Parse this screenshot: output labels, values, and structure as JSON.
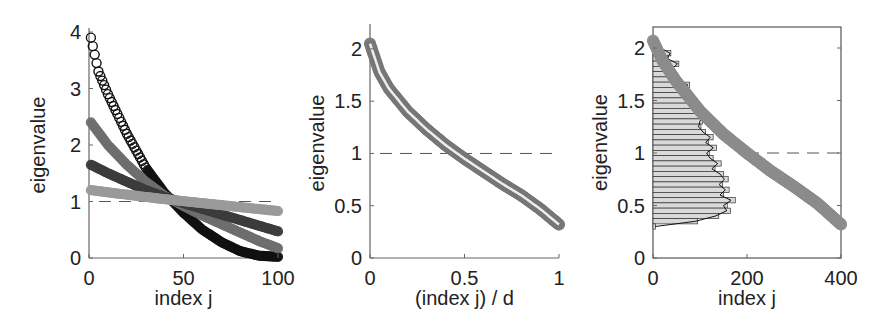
{
  "chart_data": [
    {
      "type": "scatter",
      "title": "",
      "xlabel": "index j",
      "ylabel": "eigenvalue",
      "xlim": [
        0,
        100
      ],
      "ylim": [
        0,
        4
      ],
      "xticks": [
        "0",
        "50",
        "100"
      ],
      "yticks": [
        "0",
        "1",
        "2",
        "3",
        "4"
      ],
      "reference_line": {
        "y": 1,
        "style": "dashed"
      },
      "grid": false,
      "legend": null,
      "series": [
        {
          "name": "series-black",
          "color": "#111111",
          "marker": "circle",
          "x": [
            1,
            5,
            10,
            20,
            30,
            40,
            50,
            60,
            70,
            80,
            90,
            100
          ],
          "y": [
            3.9,
            3.3,
            2.9,
            2.2,
            1.6,
            1.15,
            0.8,
            0.5,
            0.28,
            0.12,
            0.04,
            0.02
          ]
        },
        {
          "name": "series-mid-gray",
          "color": "#6e6e6e",
          "marker": "circle",
          "x": [
            1,
            10,
            20,
            30,
            40,
            50,
            60,
            70,
            80,
            90,
            100
          ],
          "y": [
            2.4,
            2.0,
            1.65,
            1.35,
            1.1,
            0.92,
            0.75,
            0.6,
            0.45,
            0.3,
            0.17
          ]
        },
        {
          "name": "series-dark-gray",
          "color": "#3c3c3c",
          "marker": "circle",
          "x": [
            1,
            10,
            20,
            30,
            40,
            50,
            60,
            70,
            80,
            90,
            100
          ],
          "y": [
            1.65,
            1.5,
            1.35,
            1.2,
            1.08,
            0.97,
            0.87,
            0.77,
            0.67,
            0.57,
            0.47
          ]
        },
        {
          "name": "series-light-gray",
          "color": "#9a9a9a",
          "marker": "circle",
          "x": [
            1,
            20,
            40,
            60,
            80,
            100
          ],
          "y": [
            1.2,
            1.12,
            1.04,
            0.97,
            0.9,
            0.83
          ]
        }
      ]
    },
    {
      "type": "scatter",
      "title": "",
      "xlabel": "(index j) / d",
      "ylabel": "eigenvalue",
      "xlim": [
        0,
        1
      ],
      "ylim": [
        0,
        2.2
      ],
      "xticks": [
        "0",
        "0.5",
        "1"
      ],
      "yticks": [
        "0",
        "0.5",
        "1",
        "1.5",
        "2"
      ],
      "reference_line": {
        "y": 1,
        "style": "dashed"
      },
      "grid": false,
      "legend": null,
      "series": [
        {
          "name": "overlaid-spectra",
          "color": "#777777",
          "marker": "circle",
          "x": [
            0,
            0.05,
            0.1,
            0.2,
            0.3,
            0.4,
            0.5,
            0.6,
            0.7,
            0.8,
            0.9,
            1.0
          ],
          "y": [
            2.05,
            1.78,
            1.62,
            1.4,
            1.23,
            1.08,
            0.95,
            0.83,
            0.71,
            0.6,
            0.47,
            0.32
          ]
        }
      ]
    },
    {
      "type": "scatter",
      "title": "",
      "xlabel": "index j",
      "ylabel": "eigenvalue",
      "xlim": [
        0,
        400
      ],
      "ylim": [
        0,
        2.2
      ],
      "xticks": [
        "0",
        "200",
        "400"
      ],
      "yticks": [
        "0",
        "0.5",
        "1",
        "1.5",
        "2"
      ],
      "reference_line": {
        "y": 1,
        "style": "dashed",
        "x_from": 200
      },
      "grid": false,
      "legend": null,
      "series": [
        {
          "name": "eigenvalues",
          "color": "#8c8c8c",
          "marker": "circle",
          "x": [
            0,
            20,
            50,
            100,
            150,
            200,
            250,
            300,
            350,
            400
          ],
          "y": [
            2.07,
            1.88,
            1.68,
            1.4,
            1.18,
            1.0,
            0.83,
            0.68,
            0.52,
            0.32
          ]
        }
      ],
      "histogram": {
        "orientation": "horizontal",
        "bin_centers": [
          2.05,
          2.0,
          1.95,
          1.9,
          1.85,
          1.8,
          1.75,
          1.7,
          1.65,
          1.6,
          1.55,
          1.5,
          1.45,
          1.4,
          1.35,
          1.3,
          1.25,
          1.2,
          1.15,
          1.1,
          1.05,
          1.0,
          0.95,
          0.9,
          0.85,
          0.8,
          0.75,
          0.7,
          0.65,
          0.6,
          0.55,
          0.5,
          0.45,
          0.4,
          0.35,
          0.3
        ],
        "counts": [
          10,
          18,
          38,
          32,
          55,
          42,
          48,
          55,
          78,
          70,
          82,
          92,
          88,
          96,
          110,
          105,
          102,
          112,
          128,
          118,
          135,
          120,
          128,
          145,
          132,
          150,
          160,
          148,
          162,
          150,
          175,
          158,
          165,
          140,
          95,
          5
        ],
        "fill": "#d9d9d9",
        "edge": "#333333",
        "density_curve": true
      }
    }
  ]
}
